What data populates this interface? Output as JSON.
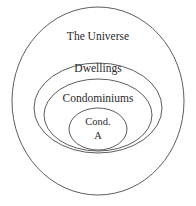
{
  "diagram": {
    "kind": "euler-nested-sets",
    "background_color": "#ffffff",
    "stroke_color": "#4a4a4a",
    "text_color": "#2b2b2b",
    "sets": [
      {
        "id": "universe",
        "label": "The Universe",
        "shape": "circle",
        "level": 0
      },
      {
        "id": "dwellings",
        "label": "Dwellings",
        "shape": "ellipse",
        "level": 1
      },
      {
        "id": "condominiums",
        "label": "Condominiums",
        "shape": "ellipse",
        "level": 2
      },
      {
        "id": "cond-a",
        "label_line1": "Cond.",
        "label_line2": "A",
        "shape": "ellipse",
        "level": 3
      }
    ]
  }
}
